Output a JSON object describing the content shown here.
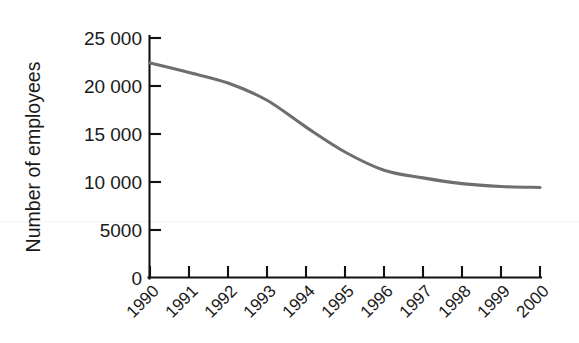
{
  "chart_data": {
    "type": "line",
    "title": "",
    "xlabel": "",
    "ylabel": "Number of employees",
    "categories": [
      "1990",
      "1991",
      "1992",
      "1993",
      "1994",
      "1995",
      "1996",
      "1997",
      "1998",
      "1999",
      "2000"
    ],
    "x": [
      1990,
      1991,
      1992,
      1993,
      1994,
      1995,
      1996,
      1997,
      1998,
      1999,
      2000
    ],
    "values": [
      22400,
      21400,
      20300,
      18500,
      15700,
      13100,
      11200,
      10400,
      9800,
      9500,
      9400
    ],
    "series": [
      {
        "name": "Number of employees",
        "values": [
          22400,
          21400,
          20300,
          18500,
          15700,
          13100,
          11200,
          10400,
          9800,
          9500,
          9400
        ],
        "color": "#6e6e6e"
      }
    ],
    "ylim": [
      0,
      25000
    ],
    "xlim": [
      1990,
      2000
    ],
    "yticks": [
      0,
      5000,
      10000,
      15000,
      20000,
      25000
    ],
    "ytick_labels": [
      "0",
      "5000",
      "10 000",
      "15 000",
      "20 000",
      "25 000"
    ],
    "xtick_labels": [
      "1990",
      "1991",
      "1992",
      "1993",
      "1994",
      "1995",
      "1996",
      "1997",
      "1998",
      "1999",
      "2000"
    ],
    "xtick_label_rotation": -45,
    "grid": false,
    "legend": false,
    "legend_position": "none",
    "line_color": "#6e6e6e",
    "axis_color": "#111111",
    "background_color": "#ffffff"
  },
  "axes": {
    "y_title": "Number of employees",
    "x_title": ""
  },
  "ticks": {
    "y": [
      {
        "label": "25 000",
        "value": 25000
      },
      {
        "label": "20 000",
        "value": 20000
      },
      {
        "label": "15 000",
        "value": 15000
      },
      {
        "label": "10 000",
        "value": 10000
      },
      {
        "label": "5000",
        "value": 5000
      },
      {
        "label": "0",
        "value": 0
      }
    ],
    "x": [
      {
        "label": "1990"
      },
      {
        "label": "1991"
      },
      {
        "label": "1992"
      },
      {
        "label": "1993"
      },
      {
        "label": "1994"
      },
      {
        "label": "1995"
      },
      {
        "label": "1996"
      },
      {
        "label": "1997"
      },
      {
        "label": "1998"
      },
      {
        "label": "1999"
      },
      {
        "label": "2000"
      }
    ]
  }
}
